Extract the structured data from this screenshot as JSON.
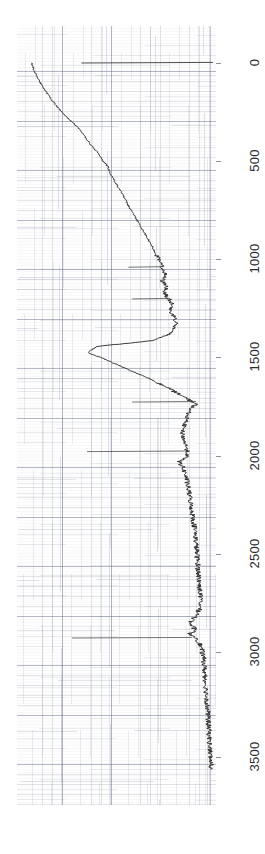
{
  "figure": {
    "kind": "ir-spectrum-scan",
    "orientation": "rotated-90-ccw",
    "background_color": "#ffffff",
    "trace_color": "#262626",
    "grid_color": "#8c93a6",
    "paper_color": "#fefefe"
  },
  "axis": {
    "name": "wavenumber-axis",
    "tick_labels": [
      "0",
      "500",
      "1000",
      "1500",
      "2000",
      "2500",
      "3000",
      "3500"
    ],
    "tick_values": [
      0,
      500,
      1000,
      1500,
      2000,
      2500,
      3000,
      3500
    ],
    "tick_y_px": [
      63,
      161,
      259,
      357,
      456,
      554,
      652,
      757
    ]
  },
  "chart_data": {
    "type": "line",
    "title": "",
    "subtitle": "",
    "xlabel": "",
    "ylabel": "",
    "xlim": [
      0,
      3600
    ],
    "ylim": [
      0,
      100
    ],
    "grid": true,
    "legend": null,
    "orientation": "x-axis-vertical-downward",
    "series": [
      {
        "name": "spectrum",
        "x": [
          0,
          40,
          80,
          120,
          170,
          220,
          270,
          320,
          360,
          400,
          430,
          460,
          490,
          520,
          560,
          600,
          640,
          680,
          720,
          760,
          800,
          840,
          880,
          920,
          950,
          980,
          1010,
          1040,
          1070,
          1100,
          1130,
          1160,
          1190,
          1220,
          1250,
          1280,
          1310,
          1340,
          1370,
          1400,
          1430,
          1460,
          1500,
          1550,
          1600,
          1650,
          1700,
          1720,
          1740,
          1780,
          1820,
          1860,
          1900,
          1940,
          1980,
          2010,
          2040,
          2080,
          2130,
          2180,
          2240,
          2300,
          2360,
          2420,
          2480,
          2540,
          2600,
          2660,
          2720,
          2780,
          2820,
          2860,
          2880,
          2900,
          2930,
          2960,
          3000,
          3060,
          3120,
          3180,
          3250,
          3320,
          3400,
          3480,
          3560
        ],
        "y": [
          3.5,
          5.0,
          7.0,
          9.5,
          13.0,
          17.0,
          22.0,
          27.5,
          31.0,
          34.0,
          36.5,
          39.5,
          41.0,
          44.0,
          45.5,
          48.0,
          50.5,
          53.0,
          55.0,
          57.5,
          60.0,
          62.5,
          65.0,
          67.5,
          69.0,
          70.5,
          72.0,
          73.5,
          74.5,
          73.0,
          75.5,
          74.0,
          76.5,
          78.5,
          77.0,
          79.5,
          80.5,
          79.0,
          76.0,
          68.0,
          38.0,
          33.5,
          44.0,
          56.0,
          68.0,
          78.0,
          87.5,
          91.5,
          88.0,
          86.5,
          85.0,
          83.5,
          84.5,
          86.0,
          86.5,
          82.0,
          84.0,
          85.5,
          86.5,
          87.5,
          88.5,
          89.5,
          90.5,
          91.0,
          91.5,
          92.0,
          92.5,
          93.0,
          93.5,
          92.0,
          88.0,
          90.5,
          87.5,
          91.5,
          93.0,
          94.0,
          95.0,
          95.5,
          96.0,
          96.5,
          97.0,
          97.5,
          98.0,
          98.5,
          99.0
        ]
      }
    ],
    "annotations": [
      {
        "name": "baseline-line",
        "at_wavenumber": 0,
        "from_value": 30,
        "to_value": 100,
        "description": "horizontal reference line across top of frame"
      },
      {
        "name": "marker-line-1030",
        "at_wavenumber": 1030,
        "from_value": 55,
        "to_value": 74,
        "description": "short horizontal pen stroke"
      },
      {
        "name": "marker-line-1190",
        "at_wavenumber": 1190,
        "from_value": 57,
        "to_value": 77,
        "description": "short horizontal pen stroke"
      },
      {
        "name": "marker-line-1710",
        "at_wavenumber": 1710,
        "from_value": 57,
        "to_value": 91,
        "description": "horizontal pen stroke at carbonyl region"
      },
      {
        "name": "marker-line-1960",
        "at_wavenumber": 1960,
        "from_value": 33,
        "to_value": 85,
        "description": "long horizontal pen stroke"
      },
      {
        "name": "marker-line-2900",
        "at_wavenumber": 2900,
        "from_value": 25,
        "to_value": 89,
        "description": "long horizontal pen stroke at CH stretch region"
      }
    ]
  },
  "labels": {
    "tick_0": "0",
    "tick_500": "500",
    "tick_1000": "1000",
    "tick_1500": "1500",
    "tick_2000": "2000",
    "tick_2500": "2500",
    "tick_3000": "3000",
    "tick_3500": "3500"
  }
}
